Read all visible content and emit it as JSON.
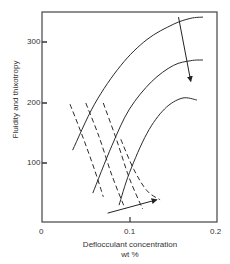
{
  "chart_data": {
    "type": "line",
    "title": "",
    "xlabel": "Deflocculant concentration",
    "xlabel_unit": "wt %",
    "ylabel": "Fluidity and thixotropy",
    "xlim": [
      0,
      0.2
    ],
    "ylim": [
      0,
      350
    ],
    "x_ticks": [
      "0",
      "0.1",
      "0.2"
    ],
    "y_ticks": [
      "100",
      "200",
      "300"
    ],
    "grid": false,
    "legend": null,
    "series": [
      {
        "name": "fluidity-curve-1",
        "style": "solid",
        "x": [
          0.035,
          0.06,
          0.09,
          0.12,
          0.15,
          0.17,
          0.184
        ],
        "y": [
          122,
          198,
          262,
          305,
          330,
          340,
          342
        ]
      },
      {
        "name": "fluidity-curve-2",
        "style": "solid",
        "x": [
          0.058,
          0.08,
          0.1,
          0.125,
          0.15,
          0.17,
          0.184
        ],
        "y": [
          51,
          130,
          190,
          235,
          262,
          270,
          271
        ]
      },
      {
        "name": "fluidity-curve-3",
        "style": "solid",
        "x": [
          0.088,
          0.1,
          0.12,
          0.14,
          0.16,
          0.177
        ],
        "y": [
          31,
          85,
          150,
          190,
          208,
          205
        ]
      },
      {
        "name": "thixotropy-curve-1",
        "style": "dashed",
        "x": [
          0.032,
          0.045,
          0.06,
          0.07
        ],
        "y": [
          198,
          150,
          90,
          45
        ]
      },
      {
        "name": "thixotropy-curve-2",
        "style": "dashed",
        "x": [
          0.05,
          0.065,
          0.08,
          0.095
        ],
        "y": [
          200,
          145,
          80,
          25
        ]
      },
      {
        "name": "thixotropy-curve-3",
        "style": "dashed",
        "x": [
          0.07,
          0.085,
          0.1,
          0.115
        ],
        "y": [
          200,
          140,
          75,
          25
        ]
      },
      {
        "name": "thixotropy-curve-4",
        "style": "dashed",
        "x": [
          0.09,
          0.105,
          0.12,
          0.135
        ],
        "y": [
          140,
          90,
          55,
          40
        ]
      }
    ],
    "annotations": [
      {
        "type": "arrow",
        "label": "trend-arrow-down",
        "from": [
          0.156,
          342
        ],
        "to": [
          0.17,
          236
        ]
      },
      {
        "type": "arrow",
        "label": "trend-arrow-right",
        "from": [
          0.075,
          18
        ],
        "to": [
          0.131,
          40
        ]
      }
    ]
  },
  "axes": {
    "ylabel": "Fluidity and thixotropy",
    "xlabel_line1": "Deflocculant concentration",
    "xlabel_line2": "wt %",
    "xtick_0": "0",
    "xtick_1": "0.1",
    "xtick_2": "0.2",
    "ytick_100": "100",
    "ytick_200": "200",
    "ytick_300": "300"
  }
}
